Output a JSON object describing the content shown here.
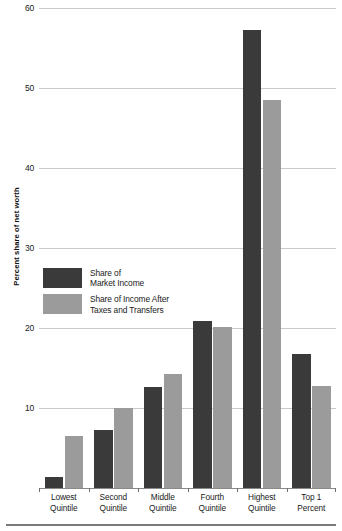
{
  "chart_data": {
    "type": "bar",
    "title": "",
    "xlabel": "",
    "ylabel": "Percent share of net worth",
    "ylim": [
      0,
      60
    ],
    "yticks": [
      10,
      20,
      30,
      40,
      50,
      60
    ],
    "ytick_labels": [
      "10",
      "20",
      "30",
      "40",
      "50",
      "60"
    ],
    "grid": true,
    "legend_position": "inside-left",
    "categories": [
      "Lowest Quintile",
      "Second Quintile",
      "Middle Quintile",
      "Fourth Quintile",
      "Highest Quintile",
      "Top 1 Percent"
    ],
    "category_lines": [
      [
        "Lowest",
        "Quintile"
      ],
      [
        "Second",
        "Quintile"
      ],
      [
        "Middle",
        "Quintile"
      ],
      [
        "Fourth",
        "Quintile"
      ],
      [
        "Highest",
        "Quintile"
      ],
      [
        "Top 1 Percent",
        ""
      ]
    ],
    "series": [
      {
        "name": "Share of Market Income",
        "name_lines": [
          "Share of",
          "Market Income"
        ],
        "color": "#3a3a3a",
        "values": [
          1.4,
          7.2,
          12.6,
          20.9,
          57.2,
          16.8
        ]
      },
      {
        "name": "Share of Income After Taxes and Transfers",
        "name_lines": [
          "Share of Income After",
          "Taxes and Transfers"
        ],
        "color": "#9b9b9b",
        "values": [
          6.5,
          10.0,
          14.2,
          20.1,
          48.5,
          12.8
        ]
      }
    ]
  }
}
